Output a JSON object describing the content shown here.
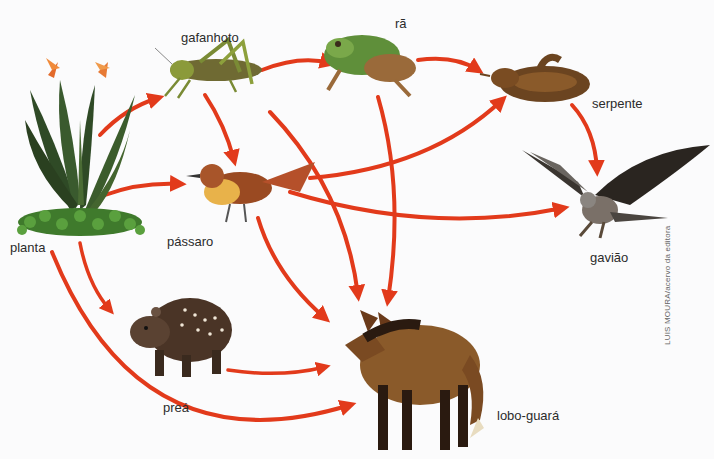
{
  "diagram": {
    "type": "food-web",
    "arrow_color": "#e23a1b",
    "organisms": [
      {
        "id": "planta",
        "label": "planta"
      },
      {
        "id": "gafanhoto",
        "label": "gafanhoto"
      },
      {
        "id": "ra",
        "label": "rã"
      },
      {
        "id": "serpente",
        "label": "serpente"
      },
      {
        "id": "passaro",
        "label": "pássaro"
      },
      {
        "id": "gaviao",
        "label": "gavião"
      },
      {
        "id": "prea",
        "label": "preá"
      },
      {
        "id": "lobo",
        "label": "lobo-guará"
      }
    ],
    "edges": [
      {
        "from": "planta",
        "to": "gafanhoto"
      },
      {
        "from": "planta",
        "to": "passaro"
      },
      {
        "from": "planta",
        "to": "prea"
      },
      {
        "from": "planta",
        "to": "lobo-guará"
      },
      {
        "from": "gafanhoto",
        "to": "rã"
      },
      {
        "from": "gafanhoto",
        "to": "pássaro"
      },
      {
        "from": "gafanhoto",
        "to": "lobo-guará"
      },
      {
        "from": "rã",
        "to": "serpente"
      },
      {
        "from": "rã",
        "to": "lobo-guará"
      },
      {
        "from": "serpente",
        "to": "gavião"
      },
      {
        "from": "pássaro",
        "to": "serpente"
      },
      {
        "from": "pássaro",
        "to": "gavião"
      },
      {
        "from": "pássaro",
        "to": "lobo-guará"
      },
      {
        "from": "preá",
        "to": "lobo-guará"
      }
    ],
    "credit": "LUIS MOURA/acervo da editora"
  }
}
